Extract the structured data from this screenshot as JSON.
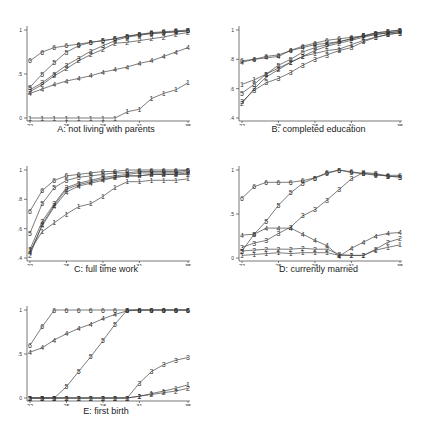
{
  "chart_data": [
    {
      "id": "A",
      "type": "line",
      "title": "A: not living with parents",
      "xlabel": "age",
      "ylabel": "",
      "xticks": [
        "22",
        "25",
        "28",
        "31",
        "35"
      ],
      "yticks": [
        "0",
        ".5",
        "1"
      ],
      "ylim": [
        0,
        1
      ],
      "xlim": [
        22,
        35
      ],
      "grid": false,
      "legend": "line markers are group numbers 1-6",
      "x": [
        22,
        23,
        24,
        25,
        26,
        27,
        28,
        29,
        30,
        31,
        32,
        33,
        34,
        35
      ],
      "series": [
        {
          "name": "1",
          "values": [
            0.0,
            0.0,
            0.0,
            0.0,
            0.0,
            0.0,
            0.0,
            0.0,
            0.07,
            0.1,
            0.22,
            0.28,
            0.32,
            0.4
          ]
        },
        {
          "name": "2",
          "values": [
            0.3,
            0.38,
            0.48,
            0.56,
            0.65,
            0.72,
            0.78,
            0.85,
            0.86,
            0.88,
            0.9,
            0.92,
            0.95,
            0.97
          ]
        },
        {
          "name": "3",
          "values": [
            0.32,
            0.4,
            0.5,
            0.6,
            0.68,
            0.76,
            0.82,
            0.88,
            0.92,
            0.94,
            0.96,
            0.97,
            0.98,
            0.99
          ]
        },
        {
          "name": "4",
          "values": [
            0.28,
            0.33,
            0.38,
            0.42,
            0.45,
            0.48,
            0.52,
            0.55,
            0.58,
            0.62,
            0.65,
            0.7,
            0.75,
            0.8
          ]
        },
        {
          "name": "5",
          "values": [
            0.35,
            0.5,
            0.63,
            0.75,
            0.82,
            0.86,
            0.88,
            0.9,
            0.93,
            0.95,
            0.96,
            0.97,
            0.98,
            0.99
          ]
        },
        {
          "name": "6",
          "values": [
            0.65,
            0.75,
            0.8,
            0.82,
            0.84,
            0.86,
            0.88,
            0.9,
            0.93,
            0.95,
            0.97,
            0.98,
            0.99,
            1.0
          ]
        }
      ]
    },
    {
      "id": "B",
      "type": "line",
      "title": "B: completed education",
      "xlabel": "age",
      "ylabel": "",
      "xticks": [
        "22",
        "25",
        "28",
        "31",
        "35"
      ],
      "yticks": [
        ".4",
        ".6",
        ".8",
        "1"
      ],
      "ylim": [
        0.4,
        1
      ],
      "xlim": [
        22,
        35
      ],
      "grid": false,
      "x": [
        22,
        23,
        24,
        25,
        26,
        27,
        28,
        29,
        30,
        31,
        32,
        33,
        34,
        35
      ],
      "series": [
        {
          "name": "1",
          "values": [
            0.63,
            0.66,
            0.7,
            0.74,
            0.78,
            0.82,
            0.84,
            0.86,
            0.87,
            0.9,
            0.93,
            0.95,
            0.97,
            0.98
          ]
        },
        {
          "name": "2",
          "values": [
            0.5,
            0.6,
            0.68,
            0.73,
            0.78,
            0.82,
            0.86,
            0.89,
            0.91,
            0.93,
            0.95,
            0.97,
            0.98,
            0.99
          ]
        },
        {
          "name": "3",
          "values": [
            0.51,
            0.59,
            0.64,
            0.67,
            0.71,
            0.76,
            0.8,
            0.83,
            0.86,
            0.88,
            0.92,
            0.95,
            0.97,
            0.98
          ]
        },
        {
          "name": "4",
          "values": [
            0.78,
            0.8,
            0.81,
            0.82,
            0.86,
            0.88,
            0.9,
            0.91,
            0.92,
            0.94,
            0.96,
            0.97,
            0.98,
            0.99
          ]
        },
        {
          "name": "5",
          "values": [
            0.57,
            0.63,
            0.7,
            0.76,
            0.8,
            0.85,
            0.88,
            0.9,
            0.92,
            0.94,
            0.96,
            0.98,
            0.99,
            1.0
          ]
        },
        {
          "name": "6",
          "values": [
            0.79,
            0.8,
            0.82,
            0.83,
            0.86,
            0.89,
            0.91,
            0.93,
            0.94,
            0.95,
            0.96,
            0.98,
            0.99,
            1.0
          ]
        }
      ]
    },
    {
      "id": "C",
      "type": "line",
      "title": "C: full time work",
      "xlabel": "age",
      "ylabel": "",
      "xticks": [
        "22",
        "25",
        "28",
        "31",
        "35"
      ],
      "yticks": [
        ".4",
        ".6",
        ".8",
        "1"
      ],
      "ylim": [
        0.4,
        1
      ],
      "xlim": [
        22,
        35
      ],
      "grid": false,
      "x": [
        22,
        23,
        24,
        25,
        26,
        27,
        28,
        29,
        30,
        31,
        32,
        33,
        34,
        35
      ],
      "series": [
        {
          "name": "1",
          "values": [
            0.45,
            0.58,
            0.64,
            0.7,
            0.75,
            0.77,
            0.82,
            0.88,
            0.92,
            0.92,
            0.93,
            0.93,
            0.93,
            0.94
          ]
        },
        {
          "name": "2",
          "values": [
            0.42,
            0.63,
            0.76,
            0.87,
            0.9,
            0.92,
            0.94,
            0.95,
            0.96,
            0.96,
            0.97,
            0.97,
            0.97,
            0.97
          ]
        },
        {
          "name": "3",
          "values": [
            0.46,
            0.65,
            0.77,
            0.88,
            0.91,
            0.93,
            0.95,
            0.96,
            0.97,
            0.98,
            0.98,
            0.98,
            0.98,
            0.99
          ]
        },
        {
          "name": "4",
          "values": [
            0.44,
            0.62,
            0.75,
            0.85,
            0.89,
            0.91,
            0.93,
            0.95,
            0.96,
            0.96,
            0.97,
            0.97,
            0.97,
            0.98
          ]
        },
        {
          "name": "5",
          "values": [
            0.57,
            0.77,
            0.88,
            0.93,
            0.95,
            0.96,
            0.97,
            0.98,
            0.98,
            0.99,
            0.99,
            0.99,
            0.99,
            1.0
          ]
        },
        {
          "name": "6",
          "values": [
            0.72,
            0.86,
            0.93,
            0.96,
            0.97,
            0.98,
            0.99,
            0.99,
            1.0,
            1.0,
            1.0,
            1.0,
            1.0,
            1.0
          ]
        }
      ]
    },
    {
      "id": "D",
      "type": "line",
      "title": "D: currently married",
      "xlabel": "age",
      "ylabel": "",
      "xticks": [
        "22",
        "25",
        "28",
        "31",
        "35"
      ],
      "yticks": [
        "0",
        ".5",
        "1"
      ],
      "ylim": [
        0,
        1
      ],
      "xlim": [
        22,
        35
      ],
      "grid": false,
      "x": [
        22,
        23,
        24,
        25,
        26,
        27,
        28,
        29,
        30,
        31,
        32,
        33,
        34,
        35
      ],
      "series": [
        {
          "name": "1",
          "values": [
            0.03,
            0.04,
            0.05,
            0.06,
            0.05,
            0.06,
            0.06,
            0.06,
            0.03,
            0.03,
            0.03,
            0.09,
            0.12,
            0.15
          ]
        },
        {
          "name": "2",
          "values": [
            0.08,
            0.09,
            0.1,
            0.1,
            0.1,
            0.11,
            0.1,
            0.1,
            0.04,
            0.03,
            0.03,
            0.1,
            0.18,
            0.22
          ]
        },
        {
          "name": "3",
          "values": [
            0.12,
            0.17,
            0.2,
            0.28,
            0.35,
            0.48,
            0.55,
            0.66,
            0.78,
            0.9,
            0.97,
            0.96,
            0.93,
            0.92
          ]
        },
        {
          "name": "4",
          "values": [
            0.26,
            0.27,
            0.34,
            0.34,
            0.34,
            0.27,
            0.2,
            0.14,
            0.02,
            0.11,
            0.18,
            0.25,
            0.28,
            0.29
          ]
        },
        {
          "name": "5",
          "values": [
            0.08,
            0.27,
            0.42,
            0.6,
            0.74,
            0.85,
            0.91,
            0.96,
            1.0,
            0.97,
            0.96,
            0.95,
            0.93,
            0.92
          ]
        },
        {
          "name": "6",
          "values": [
            0.68,
            0.81,
            0.86,
            0.86,
            0.86,
            0.88,
            0.91,
            0.97,
            1.0,
            0.98,
            0.96,
            0.94,
            0.94,
            0.94
          ]
        }
      ]
    },
    {
      "id": "E",
      "type": "line",
      "title": "E: first birth",
      "xlabel": "age",
      "ylabel": "",
      "xticks": [
        "22",
        "25",
        "28",
        "31",
        "35"
      ],
      "yticks": [
        "0",
        ".5",
        "1"
      ],
      "ylim": [
        0,
        1
      ],
      "xlim": [
        22,
        35
      ],
      "grid": false,
      "x": [
        22,
        23,
        24,
        25,
        26,
        27,
        28,
        29,
        30,
        31,
        32,
        33,
        34,
        35
      ],
      "series": [
        {
          "name": "1",
          "values": [
            0.0,
            0.0,
            0.0,
            0.0,
            0.0,
            0.0,
            0.0,
            0.0,
            0.0,
            0.02,
            0.05,
            0.08,
            0.11,
            0.15
          ]
        },
        {
          "name": "2",
          "values": [
            0.0,
            0.0,
            0.0,
            0.0,
            0.0,
            0.0,
            0.0,
            0.0,
            0.0,
            0.02,
            0.04,
            0.06,
            0.08,
            0.11
          ]
        },
        {
          "name": "3",
          "values": [
            0.0,
            0.0,
            0.0,
            0.0,
            0.0,
            0.0,
            0.0,
            0.0,
            0.0,
            0.17,
            0.3,
            0.38,
            0.43,
            0.46
          ]
        },
        {
          "name": "4",
          "values": [
            0.52,
            0.57,
            0.66,
            0.73,
            0.79,
            0.84,
            0.9,
            0.95,
            0.99,
            1.0,
            1.0,
            1.0,
            1.0,
            1.0
          ]
        },
        {
          "name": "5",
          "values": [
            0.0,
            0.0,
            0.0,
            0.13,
            0.3,
            0.47,
            0.65,
            0.84,
            1.0,
            1.0,
            1.0,
            1.0,
            1.0,
            1.0
          ]
        },
        {
          "name": "6",
          "values": [
            0.6,
            0.81,
            1.0,
            1.0,
            1.0,
            1.0,
            1.0,
            1.0,
            1.0,
            1.0,
            1.0,
            1.0,
            1.0,
            1.0
          ]
        }
      ]
    }
  ],
  "style": {
    "line_color": "#444444",
    "marker_color": "#222222",
    "axis_color": "#555555"
  }
}
